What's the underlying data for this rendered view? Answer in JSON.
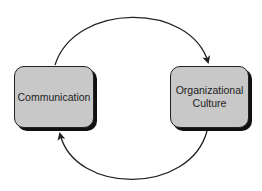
{
  "diagram": {
    "nodes": [
      {
        "id": "communication",
        "label": "Communication"
      },
      {
        "id": "organizational-culture",
        "label": "Organizational\nCulture"
      }
    ],
    "edges": [
      {
        "from": "communication",
        "to": "organizational-culture",
        "path": "top-arc"
      },
      {
        "from": "organizational-culture",
        "to": "communication",
        "path": "bottom-arc"
      }
    ],
    "colors": {
      "box_fill": "#c8c8c8",
      "stroke": "#222222",
      "shadow": "#111111"
    }
  }
}
